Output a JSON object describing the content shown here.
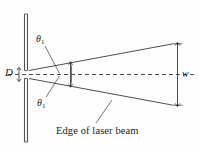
{
  "figure": {
    "type": "optics-diagram",
    "background_color": "#fefefe",
    "line_color": "#3a3a3a",
    "text_color": "#1c1c1c",
    "labels": {
      "slit_width": "D",
      "beam_width": "w",
      "angle_top_symbol": "θ",
      "angle_top_subscript": "1",
      "angle_bottom_symbol": "θ",
      "angle_bottom_subscript": "1",
      "caption": "Edge of laser beam"
    },
    "elements": {
      "barrier_name": "vertical barrier with slit",
      "centerline_name": "optical axis (dashed)",
      "beam_upper_edge_name": "upper edge of laser beam",
      "beam_lower_edge_name": "lower edge of laser beam",
      "width_dimension_name": "beam width dimension arrow",
      "slit_dimension_name": "slit width dimension arrow",
      "near_width_marker_name": "near-field width marker"
    }
  }
}
